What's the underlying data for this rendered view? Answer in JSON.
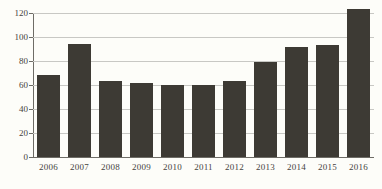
{
  "chart_data": {
    "type": "bar",
    "title": "",
    "subtitle": "",
    "xlabel": "",
    "ylabel": "",
    "categories": [
      "2006",
      "2007",
      "2008",
      "2009",
      "2010",
      "2011",
      "2012",
      "2013",
      "2014",
      "2015",
      "2016"
    ],
    "values": [
      68,
      94,
      63,
      62,
      60,
      60,
      63,
      79,
      92,
      93,
      123
    ],
    "series": [
      {
        "name": "",
        "values": [
          68,
          94,
          63,
          62,
          60,
          60,
          63,
          79,
          92,
          93,
          123
        ]
      }
    ],
    "ylim": [
      0,
      130
    ],
    "yticks": [
      0,
      20,
      40,
      60,
      80,
      100,
      120
    ],
    "ytick_labels": [
      "0",
      "20",
      "40",
      "60",
      "80",
      "100",
      "120"
    ],
    "grid": true,
    "legend": false,
    "legend_position": "none",
    "annotations": [],
    "bar_color": "#3d3a34",
    "grid_color": "#c8c8c4",
    "axis_color": "#6e6c66",
    "background_color": "#fdfdf9",
    "text_color": "#46433e"
  }
}
